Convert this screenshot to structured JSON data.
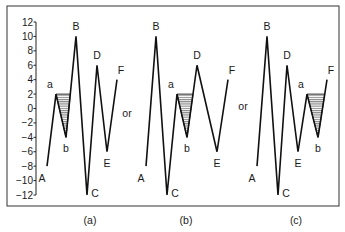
{
  "figure": {
    "frame": {
      "x": 7,
      "y": 6,
      "w": 332,
      "h": 200
    },
    "y_axis": {
      "x": 36,
      "ticks": [
        12,
        10,
        8,
        6,
        4,
        2,
        0,
        -2,
        -4,
        -6,
        -8,
        -10,
        -12
      ],
      "tick_labels": [
        "12",
        "10",
        "8",
        "6",
        "4",
        "2",
        "0",
        "−2",
        "−4",
        "−6",
        "−8",
        "−10",
        "−12"
      ],
      "px_top": 22,
      "px_bottom": 195,
      "min": -12,
      "max": 12
    },
    "separators": [
      {
        "text": "or",
        "x": 127,
        "y": 117
      },
      {
        "text": "or",
        "x": 243,
        "y": 110
      }
    ],
    "panels": [
      {
        "caption": "(a)",
        "caption_x": 90,
        "points": [
          {
            "label": "A",
            "x": 47,
            "v": -8
          },
          {
            "label": "a",
            "x": 56,
            "v": 2
          },
          {
            "label": "b",
            "x": 66,
            "v": -4
          },
          {
            "label": "B",
            "x": 76,
            "v": 10
          },
          {
            "label": "C",
            "x": 87,
            "v": -12
          },
          {
            "label": "D",
            "x": 97,
            "v": 6
          },
          {
            "label": "E",
            "x": 107,
            "v": -6
          },
          {
            "label": "F",
            "x": 117,
            "v": 4
          }
        ],
        "shade": {
          "from": "a",
          "via": "b",
          "to_next": "B"
        }
      },
      {
        "caption": "(b)",
        "caption_x": 186,
        "points": [
          {
            "label": "A",
            "x": 146,
            "v": -8
          },
          {
            "label": "B",
            "x": 156,
            "v": 10
          },
          {
            "label": "C",
            "x": 167,
            "v": -12
          },
          {
            "label": "a",
            "x": 177,
            "v": 2
          },
          {
            "label": "b",
            "x": 187,
            "v": -4
          },
          {
            "label": "D",
            "x": 197,
            "v": 6
          },
          {
            "label": "E",
            "x": 217,
            "v": -6
          },
          {
            "label": "F",
            "x": 228,
            "v": 4
          }
        ],
        "shade": {
          "from": "a",
          "via": "b",
          "to_next": "D"
        }
      },
      {
        "caption": "(c)",
        "caption_x": 296,
        "points": [
          {
            "label": "A",
            "x": 257,
            "v": -8
          },
          {
            "label": "B",
            "x": 267,
            "v": 10
          },
          {
            "label": "C",
            "x": 278,
            "v": -12
          },
          {
            "label": "D",
            "x": 287,
            "v": 6
          },
          {
            "label": "E",
            "x": 298,
            "v": -6
          },
          {
            "label": "a",
            "x": 307,
            "v": 2
          },
          {
            "label": "b",
            "x": 318,
            "v": -4
          },
          {
            "label": "F",
            "x": 327,
            "v": 4
          }
        ],
        "shade": {
          "from": "a",
          "via": "b",
          "to_next": "F"
        }
      }
    ]
  },
  "chart_data": {
    "type": "line",
    "title": "",
    "ylabel": "",
    "ylim": [
      -12,
      12
    ],
    "yticks": [
      -12,
      -10,
      -8,
      -6,
      -4,
      12,
      -2,
      0,
      2,
      4,
      6,
      8,
      10
    ],
    "series": [
      {
        "name": "(a)",
        "labels": [
          "A",
          "a",
          "b",
          "B",
          "C",
          "D",
          "E",
          "F"
        ],
        "values": [
          -8,
          2,
          -4,
          10,
          -12,
          6,
          -6,
          4
        ],
        "shaded_cycle": "a-b"
      },
      {
        "name": "(b)",
        "labels": [
          "A",
          "B",
          "C",
          "a",
          "b",
          "D",
          "E",
          "F"
        ],
        "values": [
          -8,
          10,
          -12,
          2,
          -4,
          6,
          -6,
          4
        ],
        "shaded_cycle": "a-b"
      },
      {
        "name": "(c)",
        "labels": [
          "A",
          "B",
          "C",
          "D",
          "E",
          "a",
          "b",
          "F"
        ],
        "values": [
          -8,
          10,
          -12,
          6,
          -6,
          2,
          -4,
          4
        ],
        "shaded_cycle": "a-b"
      }
    ],
    "annotations": [
      "or",
      "or"
    ]
  }
}
